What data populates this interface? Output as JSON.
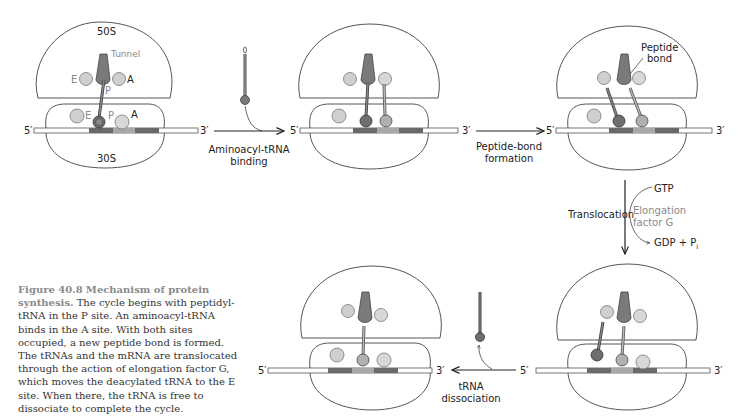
{
  "figure": {
    "number": "Figure 40.8",
    "title": "Mechanism of protein synthesis.",
    "caption": "The cycle begins with peptidyl-tRNA in the P site. An aminoacyl-tRNA binds in the A site. With both sites occupied, a new peptide bond is formed. The tRNAs and the mRNA are translocated through the action of elongation factor G, which moves the deacylated tRNA to the E site. When there, the tRNA is free to dissociate to complete the cycle."
  },
  "labels": {
    "large_subunit": "50S",
    "small_subunit": "30S",
    "tunnel": "Tunnel",
    "site_e": "E",
    "site_p": "P",
    "site_a": "A",
    "five_prime": "5′",
    "three_prime": "3′",
    "peptide_bond_line1": "Peptide",
    "peptide_bond_line2": "bond"
  },
  "steps": {
    "aminoacyl_line1": "Aminoacyl-tRNA",
    "aminoacyl_line2": "binding",
    "peptide_line1": "Peptide-bond",
    "peptide_line2": "formation",
    "translocation": "Translocation",
    "gtp": "GTP",
    "ef_line1": "Elongation",
    "ef_line2": "factor G",
    "gdp": "GDP + P",
    "gdp_sub": "i",
    "dissoc_line1": "tRNA",
    "dissoc_line2": "dissociation"
  },
  "colors": {
    "outline": "#555555",
    "site_circle": "#cfcfcf",
    "trna_dark": "#6e6e6e",
    "trna_light": "#b0b0b0",
    "codon_dark": "#6a6a6a",
    "codon_mid": "#a8a8a8",
    "codon_light": "#c2c2c2",
    "gray_text": "#8a8a8a"
  }
}
